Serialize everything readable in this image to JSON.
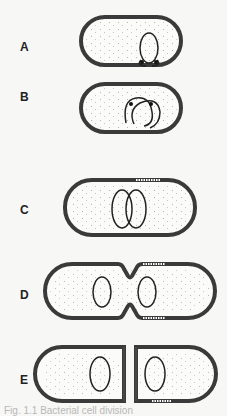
{
  "figure": {
    "stages": [
      {
        "label": "A",
        "description": "Cell with nucleoid attached to membrane"
      },
      {
        "label": "B",
        "description": "Chromosome replication begins"
      },
      {
        "label": "C",
        "description": "Cell elongation, two nucleoids"
      },
      {
        "label": "D",
        "description": "Septum formation / invagination"
      },
      {
        "label": "E",
        "description": "Separation into two daughter cells"
      }
    ],
    "caption": "Fig. 1.1  Bacterial cell division"
  },
  "colors": {
    "wall": "#3a3a3a",
    "background": "#f7f7f5",
    "label": "#222222"
  }
}
